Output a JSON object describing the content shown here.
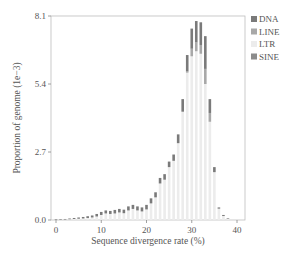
{
  "chart_data": {
    "type": "bar",
    "stacked": true,
    "title": "",
    "xlabel": "Sequence divergence rate (%)",
    "ylabel": "Proportion of genome (1e−3)",
    "xlim": [
      -1,
      41
    ],
    "ylim": [
      0,
      8.1
    ],
    "xticks": [
      0,
      10,
      20,
      30,
      40
    ],
    "yticks": [
      0.0,
      2.7,
      5.4,
      8.1
    ],
    "ytick_labels": [
      "0.0",
      "2.7",
      "5.4",
      "8.1"
    ],
    "grid": false,
    "legend_position": "upper right outside",
    "categories": [
      0,
      1,
      2,
      3,
      4,
      5,
      6,
      7,
      8,
      9,
      10,
      11,
      12,
      13,
      14,
      15,
      16,
      17,
      18,
      19,
      20,
      21,
      22,
      23,
      24,
      25,
      26,
      27,
      28,
      29,
      30,
      31,
      32,
      33,
      34,
      35,
      36,
      37,
      38
    ],
    "series": [
      {
        "name": "LTR",
        "color": "#ececec",
        "values": [
          0.01,
          0.01,
          0.02,
          0.03,
          0.04,
          0.05,
          0.06,
          0.08,
          0.1,
          0.14,
          0.2,
          0.26,
          0.24,
          0.26,
          0.3,
          0.27,
          0.38,
          0.44,
          0.38,
          0.34,
          0.42,
          0.66,
          0.9,
          1.45,
          1.6,
          2.1,
          2.35,
          3.05,
          4.3,
          5.85,
          6.5,
          6.7,
          6.6,
          5.4,
          3.9,
          1.9,
          0.45,
          0.16,
          0.05
        ]
      },
      {
        "name": "SINE",
        "color": "#8c8c8c",
        "values": [
          0,
          0,
          0,
          0,
          0,
          0,
          0,
          0,
          0,
          0,
          0,
          0,
          0,
          0,
          0,
          0,
          0,
          0,
          0,
          0,
          0,
          0,
          0,
          0,
          0,
          0,
          0,
          0,
          0,
          0,
          0,
          0,
          0,
          0,
          0,
          0,
          0,
          0,
          0
        ]
      },
      {
        "name": "LINE",
        "color": "#a8a8a8",
        "values": [
          0,
          0,
          0,
          0,
          0,
          0,
          0,
          0,
          0,
          0,
          0,
          0,
          0,
          0,
          0,
          0,
          0,
          0,
          0,
          0,
          0,
          0,
          0,
          0,
          0,
          0,
          0,
          0,
          0,
          0.05,
          0.3,
          0.35,
          0.35,
          0.6,
          0.35,
          0,
          0,
          0,
          0
        ]
      },
      {
        "name": "DNA",
        "color": "#7a7a7a",
        "values": [
          0.02,
          0.02,
          0.02,
          0.03,
          0.04,
          0.05,
          0.06,
          0.07,
          0.08,
          0.1,
          0.12,
          0.12,
          0.12,
          0.14,
          0.14,
          0.14,
          0.16,
          0.16,
          0.16,
          0.16,
          0.18,
          0.2,
          0.2,
          0.22,
          0.22,
          0.22,
          0.25,
          0.35,
          0.5,
          0.65,
          0.8,
          0.85,
          0.9,
          1.3,
          0.55,
          0.2,
          0.05,
          0.04,
          0.02
        ]
      }
    ],
    "totals_approx": [
      0.03,
      0.03,
      0.04,
      0.06,
      0.08,
      0.1,
      0.12,
      0.15,
      0.18,
      0.24,
      0.32,
      0.38,
      0.36,
      0.4,
      0.44,
      0.41,
      0.54,
      0.6,
      0.54,
      0.5,
      0.6,
      0.86,
      1.1,
      1.67,
      1.82,
      2.32,
      2.6,
      3.4,
      4.8,
      6.55,
      7.6,
      7.9,
      7.85,
      7.3,
      4.8,
      2.1,
      0.5,
      0.2,
      0.07
    ]
  },
  "legend": {
    "items": [
      {
        "label": "DNA",
        "color": "#7a7a7a"
      },
      {
        "label": "LINE",
        "color": "#a8a8a8"
      },
      {
        "label": "LTR",
        "color": "#ececec"
      },
      {
        "label": "SINE",
        "color": "#8c8c8c"
      }
    ]
  },
  "axes": {
    "xlabel": "Sequence divergence rate (%)",
    "ylabel": "Proportion of genome (1e−3)",
    "xtick_labels": [
      "0",
      "10",
      "20",
      "30",
      "40"
    ],
    "ytick_labels": [
      "0.0",
      "2.7",
      "5.4",
      "8.1"
    ]
  }
}
